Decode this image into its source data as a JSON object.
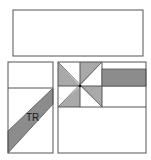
{
  "diagram": {
    "colors": {
      "stroke": "#555555",
      "shade": "#a9a9a9",
      "shade_dark": "#8c8c8c",
      "background": "#ffffff"
    },
    "top_box": {
      "label": ""
    },
    "left_panel": {
      "band_label": "TR"
    },
    "right_panel": {
      "pinwheel": "pinwheel-quilt-block",
      "bar": "shaded-bar"
    }
  }
}
